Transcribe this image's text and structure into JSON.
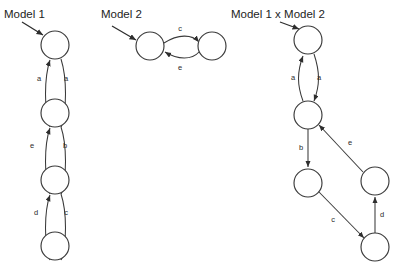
{
  "figure": {
    "type": "state-machine-product-diagram",
    "background": "#ffffff",
    "stroke_color": "#3a3a3a",
    "label_color": "#2b2b2b",
    "width": 398,
    "height": 270
  },
  "titles": {
    "model1": "Model 1",
    "model2": "Model 2",
    "product": "Model 1 x Model 2"
  },
  "model1": {
    "title": "Model 1",
    "nodes": [
      {
        "id": "m1n1",
        "cx": 55,
        "cy": 45,
        "r": 14
      },
      {
        "id": "m1n2",
        "cx": 55,
        "cy": 113,
        "r": 14
      },
      {
        "id": "m1n3",
        "cx": 55,
        "cy": 180,
        "r": 14
      },
      {
        "id": "m1n4",
        "cx": 55,
        "cy": 246,
        "r": 14
      }
    ],
    "edges": [
      {
        "label": "a",
        "from": "m1n2",
        "to": "m1n1",
        "side": "left",
        "lx": 39,
        "ly": 81
      },
      {
        "label": "a",
        "from": "m1n1",
        "to": "m1n2",
        "side": "right",
        "lx": 66,
        "ly": 81
      },
      {
        "label": "e",
        "from": "m1n3",
        "to": "m1n2",
        "side": "left",
        "lx": 32,
        "ly": 148
      },
      {
        "label": "b",
        "from": "m1n2",
        "to": "m1n3",
        "side": "right",
        "lx": 65,
        "ly": 148
      },
      {
        "label": "d",
        "from": "m1n4",
        "to": "m1n3",
        "side": "left",
        "lx": 36,
        "ly": 215
      },
      {
        "label": "c",
        "from": "m1n3",
        "to": "m1n4",
        "side": "right",
        "lx": 66,
        "ly": 215
      }
    ]
  },
  "model2": {
    "title": "Model 2",
    "nodes": [
      {
        "id": "m2n1",
        "cx": 150,
        "cy": 46,
        "r": 14
      },
      {
        "id": "m2n2",
        "cx": 212,
        "cy": 46,
        "r": 14
      }
    ],
    "edges": [
      {
        "label": "c",
        "from": "m2n1",
        "to": "m2n2",
        "side": "top",
        "lx": 178,
        "ly": 31
      },
      {
        "label": "e",
        "from": "m2n2",
        "to": "m2n1",
        "side": "bottom",
        "lx": 178,
        "ly": 68
      }
    ]
  },
  "product": {
    "title": "Model 1 x Model 2",
    "nodes": [
      {
        "id": "pn1",
        "cx": 308,
        "cy": 40,
        "r": 14
      },
      {
        "id": "pn2",
        "cx": 308,
        "cy": 115,
        "r": 14
      },
      {
        "id": "pn3",
        "cx": 308,
        "cy": 183,
        "r": 14
      },
      {
        "id": "pn4",
        "cx": 375,
        "cy": 181,
        "r": 14
      },
      {
        "id": "pn5",
        "cx": 375,
        "cy": 247,
        "r": 14
      }
    ],
    "edges": [
      {
        "label": "a",
        "from": "pn2",
        "to": "pn1",
        "side": "left",
        "lx": 293,
        "ly": 80
      },
      {
        "label": "a",
        "from": "pn1",
        "to": "pn2",
        "side": "right",
        "lx": 318,
        "ly": 80
      },
      {
        "label": "b",
        "from": "pn2",
        "to": "pn3",
        "side": "straight",
        "lx": 300,
        "ly": 150
      },
      {
        "label": "e",
        "from": "pn4",
        "to": "pn2",
        "side": "diagonal",
        "lx": 348,
        "ly": 145
      },
      {
        "label": "c",
        "from": "pn3",
        "to": "pn5",
        "side": "diagonal",
        "lx": 333,
        "ly": 222
      },
      {
        "label": "d",
        "from": "pn5",
        "to": "pn4",
        "side": "straight",
        "lx": 381,
        "ly": 217
      }
    ]
  },
  "pointers": [
    {
      "name": "model1-pointer",
      "from_x": 22,
      "from_y": 22,
      "to_x": 45,
      "to_y": 36
    },
    {
      "name": "model2-pointer",
      "from_x": 112,
      "from_y": 26,
      "to_x": 138,
      "to_y": 40
    },
    {
      "name": "product-pointer",
      "from_x": 280,
      "from_y": 22,
      "to_x": 300,
      "to_y": 30
    }
  ]
}
